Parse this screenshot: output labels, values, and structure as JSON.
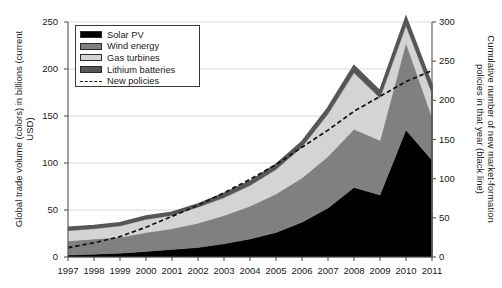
{
  "chart_data": {
    "type": "area",
    "title": "",
    "xlabel": "",
    "ylabel": "Global trade volume (colors) in billions (current USD)",
    "y2label": "Cumulative number of new market-formation policies in that year (black line)",
    "categories": [
      1997,
      1998,
      1999,
      2000,
      2001,
      2002,
      2003,
      2004,
      2005,
      2006,
      2007,
      2008,
      2009,
      2010,
      2011
    ],
    "xlim": [
      1997,
      2011
    ],
    "ylim": [
      0,
      250
    ],
    "y2lim": [
      0,
      300
    ],
    "yticks": [
      0,
      50,
      100,
      150,
      200,
      250
    ],
    "y2ticks": [
      0,
      50,
      100,
      150,
      200,
      250,
      300
    ],
    "grid": true,
    "stacked": true,
    "legend_position": "upper-left",
    "series": [
      {
        "name": "Solar PV",
        "color": "#000000",
        "type": "area",
        "values": [
          2,
          3,
          4,
          6,
          8,
          10,
          14,
          19,
          26,
          37,
          52,
          74,
          66,
          135,
          103
        ]
      },
      {
        "name": "Wind energy",
        "color": "#808080",
        "type": "area",
        "values": [
          15,
          16,
          17,
          20,
          22,
          26,
          30,
          35,
          41,
          47,
          55,
          62,
          58,
          93,
          46
        ]
      },
      {
        "name": "Gas turbines",
        "color": "#d4d4d4",
        "type": "area",
        "values": [
          11,
          11,
          12,
          14,
          14,
          17,
          19,
          22,
          26,
          33,
          45,
          60,
          45,
          18,
          25
        ]
      },
      {
        "name": "Lithium batteries",
        "color": "#565656",
        "type": "area",
        "values": [
          3,
          3,
          3,
          3,
          3,
          3,
          4,
          4,
          5,
          5,
          6,
          7,
          7,
          8,
          8
        ]
      },
      {
        "name": "New policies",
        "color": "#111111",
        "type": "line-dashed",
        "axis": "right",
        "values": [
          12,
          18,
          26,
          38,
          52,
          66,
          82,
          99,
          118,
          140,
          162,
          186,
          205,
          224,
          238
        ]
      }
    ]
  },
  "legend": {
    "items": [
      {
        "label": "Solar PV",
        "swatch": "#000000"
      },
      {
        "label": "Wind energy",
        "swatch": "#808080"
      },
      {
        "label": "Gas turbines",
        "swatch": "#d4d4d4"
      },
      {
        "label": "Lithium batteries",
        "swatch": "#565656"
      },
      {
        "label": "New policies",
        "swatch": "dashed"
      }
    ]
  }
}
